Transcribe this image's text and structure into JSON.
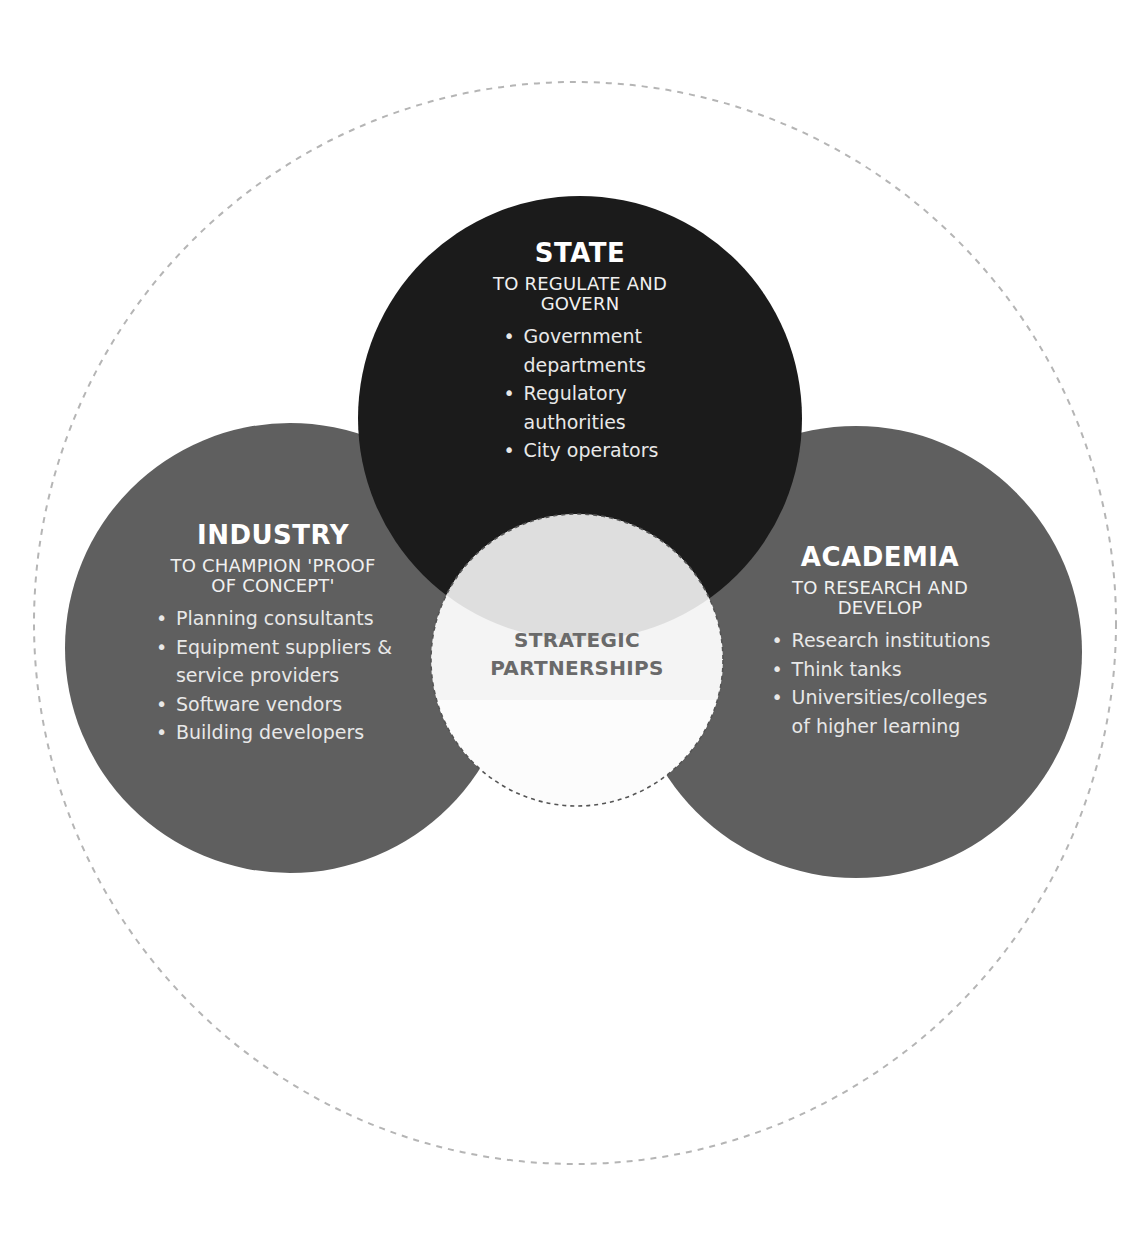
{
  "colors": {
    "background": "#ffffff",
    "state_fill": "#1b1b1b",
    "industry_fill": "#5f5f5f",
    "academia_fill": "#5f5f5f",
    "center_fill": "#f4f4f4",
    "center_overlap_fill": "#dedede",
    "outer_dashed": "#b5b5b5",
    "center_dashed": "#555555",
    "center_text": "#6a6a6a"
  },
  "state": {
    "title": "STATE",
    "subtitle_line1": "TO REGULATE AND",
    "subtitle_line2": "GOVERN",
    "items": [
      {
        "line1": "Government",
        "line2": "departments"
      },
      {
        "line1": "Regulatory",
        "line2": "authorities"
      },
      {
        "line1": "City operators",
        "line2": ""
      }
    ]
  },
  "industry": {
    "title": "INDUSTRY",
    "subtitle_line1": "TO CHAMPION 'PROOF",
    "subtitle_line2": "OF CONCEPT'",
    "items": [
      {
        "line1": "Planning consultants",
        "line2": ""
      },
      {
        "line1": "Equipment suppliers &",
        "line2": "service providers"
      },
      {
        "line1": "Software vendors",
        "line2": ""
      },
      {
        "line1": "Building developers",
        "line2": ""
      }
    ]
  },
  "academia": {
    "title": "ACADEMIA",
    "subtitle_line1": "TO RESEARCH AND",
    "subtitle_line2": "DEVELOP",
    "items": [
      {
        "line1": "Research institutions",
        "line2": ""
      },
      {
        "line1": "Think tanks",
        "line2": ""
      },
      {
        "line1": "Universities/colleges",
        "line2": "of higher learning"
      }
    ]
  },
  "center": {
    "line1": "STRATEGIC",
    "line2": "PARTNERSHIPS"
  }
}
